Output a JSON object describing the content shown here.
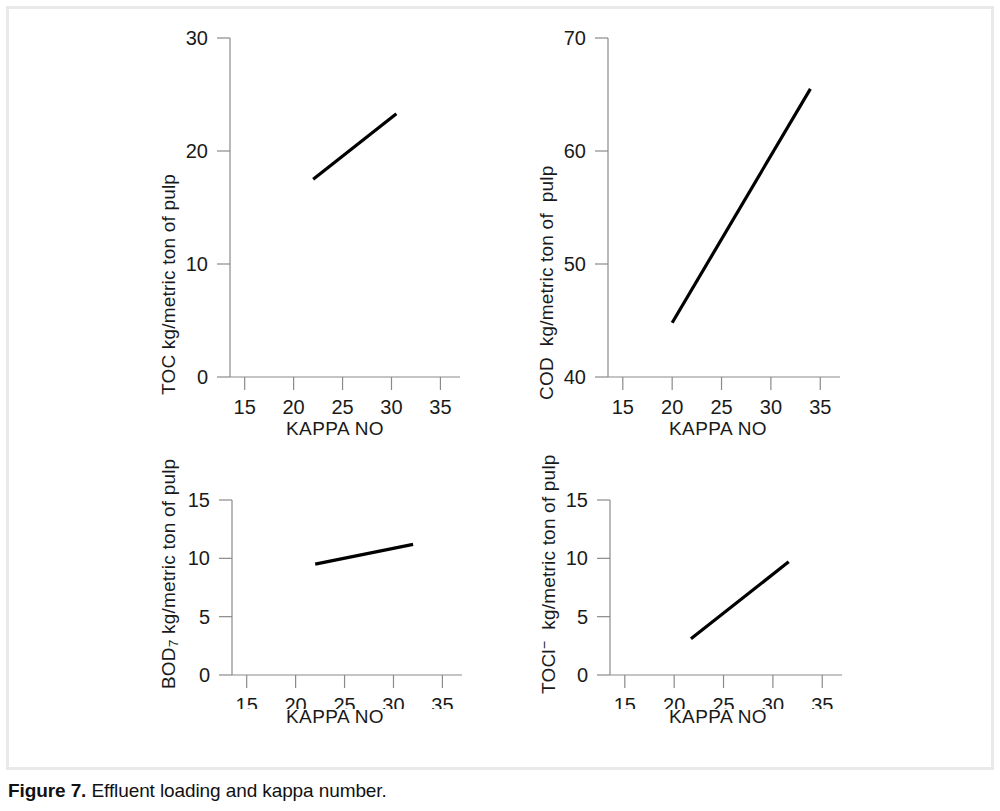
{
  "caption": {
    "label": "Figure 7.",
    "text": "Effluent loading and kappa number."
  },
  "chart_data": [
    {
      "id": "toc",
      "type": "line",
      "position": "top-left",
      "title": "",
      "xlabel": "KAPPA NO",
      "ylabel": "TOC kg/metric ton of pulp",
      "ylabel_parts": {
        "prefix": "TOC",
        "sub": "",
        "sup": "",
        "suffix": " kg/metric ton of pulp"
      },
      "xlim": [
        13.5,
        37.0
      ],
      "ylim": [
        0,
        30
      ],
      "xticks": [
        15,
        20,
        25,
        30,
        35
      ],
      "xtick_labels": [
        "15",
        "20",
        "25",
        "30",
        "35"
      ],
      "yticks": [
        0,
        10,
        20,
        30
      ],
      "ytick_labels": [
        "0",
        "10",
        "20",
        "30"
      ],
      "grid": false,
      "legend": "none",
      "series": [
        {
          "name": "TOC",
          "x": [
            22.0,
            30.5
          ],
          "y": [
            17.5,
            23.3
          ]
        }
      ]
    },
    {
      "id": "cod",
      "type": "line",
      "position": "top-right",
      "title": "",
      "xlabel": "KAPPA NO",
      "ylabel": "COD  kg/metric ton of  pulp",
      "ylabel_parts": {
        "prefix": "COD",
        "sub": "",
        "sup": "",
        "suffix": "  kg/metric ton of  pulp"
      },
      "xlim": [
        13.5,
        37.0
      ],
      "ylim": [
        40,
        70
      ],
      "xticks": [
        15,
        20,
        25,
        30,
        35
      ],
      "xtick_labels": [
        "15",
        "20",
        "25",
        "30",
        "35"
      ],
      "yticks": [
        40,
        50,
        60,
        70
      ],
      "ytick_labels": [
        "40",
        "50",
        "60",
        "70"
      ],
      "grid": false,
      "legend": "none",
      "series": [
        {
          "name": "COD",
          "x": [
            20.0,
            34.0
          ],
          "y": [
            44.8,
            65.5
          ]
        }
      ]
    },
    {
      "id": "bod7",
      "type": "line",
      "position": "bottom-left",
      "title": "",
      "xlabel": "KAPPA NO",
      "ylabel": "BOD7 kg/metric ton of pulp",
      "ylabel_parts": {
        "prefix": "BOD",
        "sub": "7",
        "sup": "",
        "suffix": " kg/metric ton of pulp"
      },
      "xlim": [
        13.5,
        37.0
      ],
      "ylim": [
        0,
        15
      ],
      "xticks": [
        15,
        20,
        25,
        30,
        35
      ],
      "xtick_labels": [
        "15",
        "20",
        "25",
        "30",
        "35"
      ],
      "yticks": [
        0,
        5,
        10,
        15
      ],
      "ytick_labels": [
        "0",
        "5",
        "10",
        "15"
      ],
      "grid": false,
      "legend": "none",
      "series": [
        {
          "name": "BOD7",
          "x": [
            22.0,
            32.0
          ],
          "y": [
            9.5,
            11.2
          ]
        }
      ]
    },
    {
      "id": "tocl",
      "type": "line",
      "position": "bottom-right",
      "title": "",
      "xlabel": "KAPPA NO",
      "ylabel": "TOCl-  kg/metric ton of pulp",
      "ylabel_parts": {
        "prefix": "TOCl",
        "sub": "",
        "sup": "−",
        "suffix": "  kg/metric ton of pulp"
      },
      "xlim": [
        13.5,
        37.0
      ],
      "ylim": [
        0,
        15
      ],
      "xticks": [
        15,
        20,
        25,
        30,
        35
      ],
      "xtick_labels": [
        "15",
        "20",
        "25",
        "30",
        "35"
      ],
      "yticks": [
        0,
        5,
        10,
        15
      ],
      "ytick_labels": [
        "0",
        "5",
        "10",
        "15"
      ],
      "grid": false,
      "legend": "none",
      "series": [
        {
          "name": "TOCl",
          "x": [
            21.7,
            31.6
          ],
          "y": [
            3.1,
            9.7
          ]
        }
      ]
    }
  ],
  "colors": {
    "line": "#000000",
    "axis": "#8a8a8a",
    "text": "#1a1a1a",
    "frame": "#e9e9e9",
    "background": "#ffffff"
  }
}
